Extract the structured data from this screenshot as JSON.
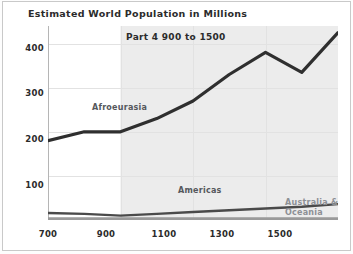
{
  "chart_data": {
    "type": "line",
    "title": "Estimated World Population in Millions",
    "subtitle": "Part 4 900 to 1500",
    "xlabel": "",
    "ylabel": "",
    "xlim": [
      700,
      1500
    ],
    "ylim": [
      0,
      440
    ],
    "xticks": [
      700,
      900,
      1100,
      1300,
      1500
    ],
    "yticks": [
      100,
      200,
      300,
      400
    ],
    "xtick_labels": [
      "700",
      "900",
      "1100",
      "1300",
      "1500"
    ],
    "ytick_labels": [
      "100",
      "200",
      "300",
      "400"
    ],
    "grid": true,
    "legend": "inline-annotations",
    "highlight_band": {
      "from": 900,
      "to": 1500
    },
    "series": [
      {
        "name": "Afroeurasia",
        "color": "#2f2f2f",
        "x": [
          700,
          800,
          900,
          1000,
          1100,
          1200,
          1300,
          1400,
          1500
        ],
        "values": [
          180,
          200,
          200,
          230,
          270,
          330,
          380,
          335,
          425
        ]
      },
      {
        "name": "Americas",
        "color": "#4a4a4a",
        "x": [
          700,
          800,
          900,
          1000,
          1100,
          1200,
          1300,
          1400,
          1500
        ],
        "values": [
          16,
          14,
          10,
          14,
          18,
          22,
          26,
          30,
          36
        ]
      },
      {
        "name": "Australia & Oceania",
        "color": "#9a9a9a",
        "x": [
          700,
          800,
          900,
          1000,
          1100,
          1200,
          1300,
          1400,
          1500
        ],
        "values": [
          3,
          3,
          3,
          3,
          3,
          3,
          3,
          3,
          3
        ]
      }
    ],
    "annotations": [
      {
        "text": "Afroeurasia",
        "x": 1010,
        "y": 278
      },
      {
        "text": "Americas",
        "x": 1230,
        "y": 60
      },
      {
        "text": "Australia &",
        "x": 1500,
        "y": 22
      },
      {
        "text": "Oceania",
        "x": 1500,
        "y": 12
      }
    ]
  },
  "chart": {
    "title": "Estimated World Population in Millions",
    "subtitle": "Part 4 900 to 1500",
    "y_ticks": [
      "400",
      "300",
      "200",
      "100"
    ],
    "x_ticks": [
      "700",
      "900",
      "1100",
      "1300",
      "1500"
    ],
    "series_labels": {
      "afroeurasia": "Afroeurasia",
      "americas": "Americas",
      "australia_line1": "Australia &",
      "australia_line2": "Oceania"
    },
    "colors": {
      "afroeurasia": "#2f2f2f",
      "americas": "#4a4a4a",
      "australia": "#9a9a9a",
      "grid": "#e2e2e2",
      "band": "#ececec",
      "axis": "#b5b5b5",
      "text": "#2b2b2b"
    }
  }
}
